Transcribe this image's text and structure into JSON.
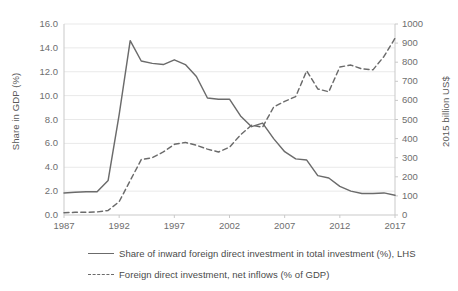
{
  "chart_data": {
    "type": "line",
    "title": "",
    "xlabel": "",
    "x": [
      1987,
      1988,
      1989,
      1990,
      1991,
      1992,
      1993,
      1994,
      1995,
      1996,
      1997,
      1998,
      1999,
      2000,
      2001,
      2002,
      2003,
      2004,
      2005,
      2006,
      2007,
      2008,
      2009,
      2010,
      2011,
      2012,
      2013,
      2014,
      2015,
      2016,
      2017
    ],
    "xlim": [
      1987,
      2017
    ],
    "xticks": [
      1987,
      1992,
      1997,
      2002,
      2007,
      2012,
      2017
    ],
    "xticklabels": [
      "1987",
      "1992",
      "1997",
      "2002",
      "2007",
      "2012",
      "2017"
    ],
    "grid": true,
    "legend_position": "bottom",
    "axes": [
      {
        "id": "left",
        "label": "Share in GDP (%)",
        "ylim": [
          0.0,
          16.0
        ],
        "yticks": [
          0.0,
          2.0,
          4.0,
          6.0,
          8.0,
          10.0,
          12.0,
          14.0,
          16.0
        ],
        "yticklabels": [
          "0.0",
          "2.0",
          "4.0",
          "6.0",
          "8.0",
          "10.0",
          "12.0",
          "14.0",
          "16.0"
        ]
      },
      {
        "id": "right",
        "label": "2015 billion US$",
        "ylim": [
          0,
          1000
        ],
        "yticks": [
          0,
          100,
          200,
          300,
          400,
          500,
          600,
          700,
          800,
          900,
          1000
        ],
        "yticklabels": [
          "0",
          "100",
          "200",
          "300",
          "400",
          "500",
          "600",
          "700",
          "800",
          "900",
          "1000"
        ]
      }
    ],
    "series": [
      {
        "name": "Share of inward foreign direct investment in total investment (%), LHS",
        "axis": "left",
        "style": "solid",
        "color": "#6b6b6b",
        "values": [
          1.85,
          1.9,
          1.95,
          1.95,
          2.9,
          8.4,
          14.6,
          12.9,
          12.7,
          12.6,
          13.0,
          12.6,
          11.6,
          9.8,
          9.7,
          9.7,
          8.3,
          7.4,
          7.7,
          6.4,
          5.3,
          4.7,
          4.6,
          3.3,
          3.1,
          2.4,
          2.0,
          1.8,
          1.8,
          1.85,
          1.65
        ]
      },
      {
        "name": "Foreign direct investment, net inflows (% of GDP)",
        "axis": "right",
        "style": "dashed",
        "color": "#6b6b6b",
        "values": [
          12,
          14,
          14,
          16,
          24,
          70,
          180,
          290,
          300,
          330,
          370,
          380,
          365,
          345,
          330,
          355,
          420,
          470,
          460,
          565,
          595,
          620,
          755,
          660,
          645,
          775,
          785,
          765,
          760,
          830,
          925
        ]
      }
    ]
  },
  "legend": {
    "items": [
      {
        "label": "Share of inward foreign direct investment in total investment (%), LHS",
        "style": "solid"
      },
      {
        "label": "Foreign direct investment, net inflows (% of GDP)",
        "style": "dashed"
      }
    ]
  }
}
